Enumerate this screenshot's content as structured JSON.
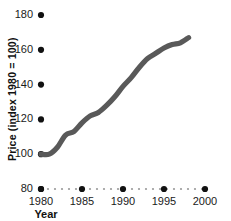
{
  "chart_data": {
    "type": "line",
    "title": "",
    "xlabel": "Year",
    "ylabel": "Price (index 1980 = 100)",
    "xlim": [
      1980,
      2000
    ],
    "ylim": [
      80,
      180
    ],
    "xticks": [
      1980,
      1985,
      1990,
      1995,
      2000
    ],
    "xtick_labels": [
      "1980",
      "1985",
      "1990",
      "1995",
      "2000"
    ],
    "yticks": [
      80,
      100,
      120,
      140,
      160,
      180
    ],
    "ytick_labels": [
      "80",
      "100",
      "120",
      "140",
      "160",
      "180"
    ],
    "grid": false,
    "legend": "none",
    "line_color": "#595959",
    "marker_color": "#111111",
    "baseline_style": "dotted",
    "series": [
      {
        "name": "Price index",
        "x": [
          1980,
          1981,
          1982,
          1983,
          1984,
          1985,
          1986,
          1987,
          1988,
          1989,
          1990,
          1991,
          1992,
          1993,
          1994,
          1995,
          1996,
          1997,
          1998
        ],
        "values": [
          100,
          100,
          104,
          111,
          113,
          118,
          122,
          124,
          128,
          133,
          139,
          144,
          150,
          155,
          158,
          161,
          163,
          164,
          167
        ]
      }
    ]
  },
  "axis": {
    "y_tick_dots": [
      "80",
      "100",
      "120",
      "140",
      "160",
      "180"
    ],
    "x_tick_dots": [
      "1980",
      "1985",
      "1990",
      "1995",
      "2000"
    ]
  }
}
